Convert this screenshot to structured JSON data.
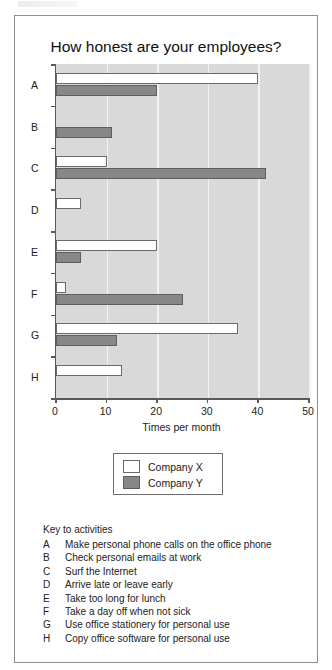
{
  "page": {
    "scan_artifact": ""
  },
  "chart_data": {
    "type": "bar",
    "orientation": "horizontal",
    "title": "How honest are your employees?",
    "xlabel": "Times per month",
    "ylabel": "",
    "xlim": [
      0,
      50
    ],
    "xticks": [
      0,
      10,
      20,
      30,
      40,
      50
    ],
    "grid": true,
    "legend_position": "below-plot",
    "categories": [
      "A",
      "B",
      "C",
      "D",
      "E",
      "F",
      "G",
      "H"
    ],
    "series": [
      {
        "name": "Company X",
        "color": "#ffffff",
        "values": [
          40,
          0,
          10,
          5,
          20,
          2,
          36,
          13
        ]
      },
      {
        "name": "Company Y",
        "color": "#878787",
        "values": [
          20,
          11,
          41.5,
          0,
          5,
          25,
          12,
          0
        ]
      }
    ]
  },
  "legend": {
    "entries": [
      {
        "label": "Company X",
        "swatch": "x"
      },
      {
        "label": "Company Y",
        "swatch": "y"
      }
    ]
  },
  "key": {
    "heading": "Key to activities",
    "items": [
      {
        "letter": "A",
        "description": "Make personal phone calls on the office phone"
      },
      {
        "letter": "B",
        "description": "Check personal emails at work"
      },
      {
        "letter": "C",
        "description": "Surf the Internet"
      },
      {
        "letter": "D",
        "description": "Arrive late or leave early"
      },
      {
        "letter": "E",
        "description": "Take too long for lunch"
      },
      {
        "letter": "F",
        "description": "Take a day off when not sick"
      },
      {
        "letter": "G",
        "description": "Use office stationery for personal use"
      },
      {
        "letter": "H",
        "description": "Copy office software for personal use"
      }
    ]
  }
}
